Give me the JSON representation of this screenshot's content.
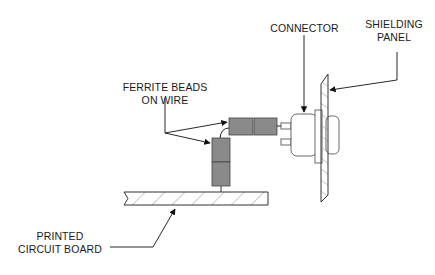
{
  "diagram": {
    "labels": {
      "connector": "CONNECTOR",
      "shielding_panel_1": "SHIELDING",
      "shielding_panel_2": "PANEL",
      "ferrite_1": "FERRITE BEADS",
      "ferrite_2": "ON WIRE",
      "pcb_1": "PRINTED",
      "pcb_2": "CIRCUIT BOARD"
    },
    "colors": {
      "bead_fill": "#8a8a8a",
      "line": "#1a1a1a",
      "hatch": "#888888"
    }
  }
}
